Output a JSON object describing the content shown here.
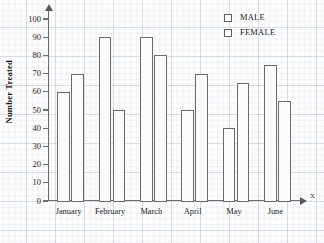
{
  "chart_data": {
    "type": "bar",
    "title": "",
    "xlabel": "",
    "ylabel": "Number Treated",
    "ylim": [
      0,
      100
    ],
    "ytick_step": 10,
    "yticks": [
      100,
      90,
      80,
      70,
      60,
      50,
      40,
      30,
      20,
      10,
      0
    ],
    "grid": true,
    "grid_style": "graph-paper",
    "legend_position": "top-right",
    "axis_labels": {
      "x_axis_letter": "X",
      "y_axis_letter": "Y"
    },
    "categories": [
      "January",
      "February",
      "March",
      "April",
      "May",
      "June"
    ],
    "series": [
      {
        "name": "MALE",
        "swatch": "male-swatch",
        "values": [
          60,
          90,
          90,
          50,
          40,
          75
        ]
      },
      {
        "name": "FEMALE",
        "swatch": "female-swatch",
        "values": [
          70,
          50,
          80,
          70,
          65,
          55
        ]
      }
    ]
  },
  "legend": {
    "items": [
      {
        "label": "MALE"
      },
      {
        "label": "FEMALE"
      }
    ]
  },
  "colors": {
    "bar_fill": "#fbfbfb",
    "bar_stroke": "#6a6a6a",
    "axis": "#6d6d6d",
    "grid_major": "#96aac8",
    "text": "#1b1b1b"
  }
}
